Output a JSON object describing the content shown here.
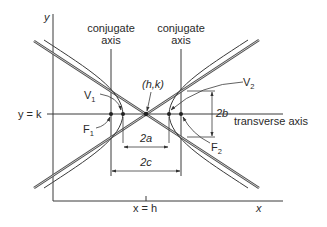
{
  "figure": {
    "axes": {
      "y_label": "y",
      "x_label": "x",
      "y_eq_k_label": "y = k",
      "x_eq_h_label": "x = h"
    },
    "labels": {
      "conjugate_axis_left_line1": "conjugate",
      "conjugate_axis_left_line2": "axis",
      "conjugate_axis_right_line1": "conjugate",
      "conjugate_axis_right_line2": "axis",
      "center": "(h,k)",
      "vertex_1": "V",
      "vertex_1_sub": "1",
      "vertex_2": "V",
      "vertex_2_sub": "2",
      "focus_1": "F",
      "focus_1_sub": "1",
      "focus_2": "F",
      "focus_2_sub": "2",
      "transverse_axis": "transverse axis",
      "dim_2a": "2a",
      "dim_2b": "2b",
      "dim_2c": "2c"
    },
    "colors": {
      "line": "#3a3a3a",
      "background": "#ffffff"
    }
  }
}
